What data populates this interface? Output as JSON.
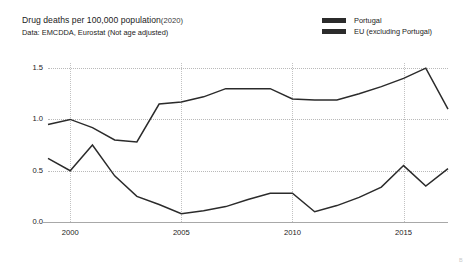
{
  "header": {
    "title_main": "Drug deaths per 100,000 population",
    "title_year": "(2020)",
    "subtitle": "Data: EMCDDA, Eurostat (Not age adjusted)"
  },
  "legend": {
    "position": "top-right",
    "items": [
      {
        "label": "Portugal",
        "color": "#2b2b2b",
        "icon": "line-swatch"
      },
      {
        "label": "EU (excluding Portugal)",
        "color": "#2b2b2b",
        "icon": "line-swatch"
      }
    ]
  },
  "corner_mark": "B",
  "chart_data": {
    "type": "line",
    "subtitle": "Data: EMCDDA, Eurostat (Not age adjusted)",
    "xlabel": "",
    "ylabel": "",
    "xlim": [
      1999,
      2017
    ],
    "ylim": [
      0.0,
      1.55
    ],
    "grid": true,
    "grid_style": "dotted",
    "legend_position": "top-right",
    "x": [
      1999,
      2000,
      2001,
      2002,
      2003,
      2004,
      2005,
      2006,
      2007,
      2008,
      2009,
      2010,
      2011,
      2012,
      2013,
      2014,
      2015,
      2016,
      2017
    ],
    "yticks": [
      0.0,
      0.5,
      1.0,
      1.5
    ],
    "ytick_labels": [
      "0.0",
      "0.5",
      "1.0",
      "1.5"
    ],
    "xticks": [
      2000,
      2005,
      2010,
      2015
    ],
    "xtick_labels": [
      "2000",
      "2005",
      "2010",
      "2015"
    ],
    "series": [
      {
        "name": "Portugal",
        "color": "#2b2b2b",
        "values": [
          0.95,
          1.0,
          0.92,
          0.8,
          0.78,
          1.15,
          1.17,
          1.22,
          1.3,
          1.3,
          1.3,
          1.2,
          1.19,
          1.19,
          1.25,
          1.32,
          1.4,
          1.5,
          1.1
        ]
      },
      {
        "name": "EU (excluding Portugal)",
        "color": "#2b2b2b",
        "values": [
          0.62,
          0.5,
          0.75,
          0.45,
          0.25,
          0.17,
          0.08,
          0.11,
          0.15,
          0.22,
          0.28,
          0.28,
          0.1,
          0.16,
          0.24,
          0.34,
          0.55,
          0.35,
          0.52
        ]
      }
    ]
  }
}
